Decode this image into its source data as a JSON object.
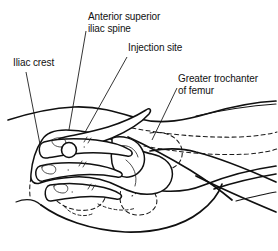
{
  "figure": {
    "background_color": "#ffffff",
    "ink_color": "#101010"
  },
  "labels": [
    {
      "id": "iliac-crest",
      "lines": [
        "Iliac crest"
      ],
      "x": 13,
      "y": 57
    },
    {
      "id": "anterior-superior-iliac-spine",
      "lines": [
        "Anterior superior",
        "iliac spine"
      ],
      "x": 88,
      "y": 11
    },
    {
      "id": "injection-site",
      "lines": [
        "Injection site"
      ],
      "x": 128,
      "y": 42
    },
    {
      "id": "greater-trochanter-of-femur",
      "lines": [
        "Greater trochanter",
        "of femur"
      ],
      "x": 178,
      "y": 73
    }
  ],
  "markers": {
    "injection_site_circle": {
      "name": "injection-site-marker",
      "cx": 69,
      "cy": 150,
      "r": 7.5
    }
  },
  "anatomy_parts": [
    "iliac-crest-contour",
    "hip-body-contour",
    "hand-outline",
    "index-finger",
    "middle-finger",
    "ring-finger",
    "little-finger",
    "thumb",
    "pelvis-bone-dashed",
    "femur-head-dashed",
    "thigh-contour",
    "buttock-contour"
  ]
}
